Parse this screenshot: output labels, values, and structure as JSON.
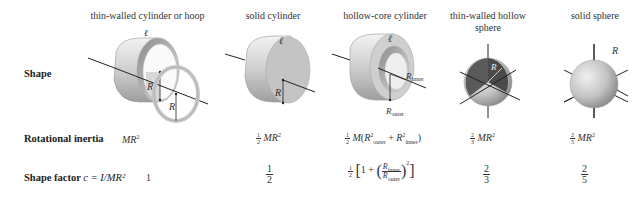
{
  "columns": [
    {
      "title": "thin-walled cylinder or hoop",
      "inertia": "MR²",
      "shape_factor": "1"
    },
    {
      "title": "solid cylinder",
      "inertia": "½MR²",
      "shape_factor": "1/2"
    },
    {
      "title": "hollow-core cylinder",
      "inertia": "½M(R²outer + R²inner)",
      "shape_factor": "½[1 + (Rinner/Router)²]"
    },
    {
      "title": "thin-walled hollow sphere",
      "inertia": "⅔MR²",
      "shape_factor": "2/3"
    },
    {
      "title": "solid sphere",
      "inertia": "⅖MR²",
      "shape_factor": "2/5"
    }
  ],
  "rows": {
    "shape": "Shape",
    "inertia": "Rotational inertia",
    "shape_factor_prefix": "Shape factor ",
    "shape_factor_formula": "c = I/MR²"
  },
  "labels": {
    "axis": "ℓ",
    "radius": "R",
    "r_inner": "R",
    "r_inner_sub": "inner",
    "r_outer": "R",
    "r_outer_sub": "outer"
  },
  "math": {
    "MR": "MR",
    "M": "M",
    "sq": "2",
    "one": "1",
    "two": "2",
    "three": "3",
    "five": "5",
    "plus": "+",
    "lparen": "(",
    "rparen": ")",
    "outer": "outer",
    "inner": "inner",
    "one_plus": "1 +",
    "lbracket": "[",
    "rbracket": "]"
  },
  "colors": {
    "shape_light": "#e6e6e6",
    "shape_mid": "#bdbdbd",
    "shape_dark": "#8a8a8a",
    "sphere_inner": "#555555",
    "line": "#222222"
  }
}
